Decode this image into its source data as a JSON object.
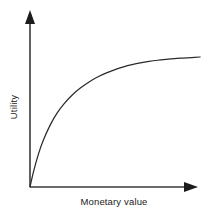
{
  "figure": {
    "background_color": "#ffffff",
    "axis_color": "#3a3a3a",
    "curve_color": "#2b2b2b",
    "width": 210,
    "height": 217
  },
  "chart_data": {
    "type": "line",
    "title": "",
    "subtitle": "",
    "xlabel": "Monetary value",
    "ylabel": "Utility",
    "grid": false,
    "legend": null,
    "legend_position": "none",
    "annotations": [],
    "xticks": [],
    "yticks": [],
    "xtick_labels": [],
    "ytick_labels": [],
    "xlim": [
      0,
      1
    ],
    "ylim": [
      0,
      1
    ],
    "series": [
      {
        "name": "Utility function",
        "color": "#2b2b2b",
        "x": [
          0.0,
          0.02,
          0.05,
          0.08,
          0.12,
          0.16,
          0.2,
          0.25,
          0.3,
          0.35,
          0.4,
          0.45,
          0.5,
          0.55,
          0.6,
          0.65,
          0.7,
          0.75,
          0.8,
          0.85,
          0.9,
          0.95,
          1.0
        ],
        "y": [
          0.0,
          0.115,
          0.255,
          0.365,
          0.48,
          0.57,
          0.64,
          0.71,
          0.765,
          0.81,
          0.848,
          0.878,
          0.903,
          0.924,
          0.941,
          0.955,
          0.966,
          0.975,
          0.982,
          0.988,
          0.992,
          0.996,
          1.0
        ]
      }
    ]
  },
  "axes": {
    "x_axis_name": "x-axis",
    "y_axis_name": "y-axis",
    "x_arrow_name": "x-axis-arrowhead",
    "y_arrow_name": "y-axis-arrowhead"
  }
}
